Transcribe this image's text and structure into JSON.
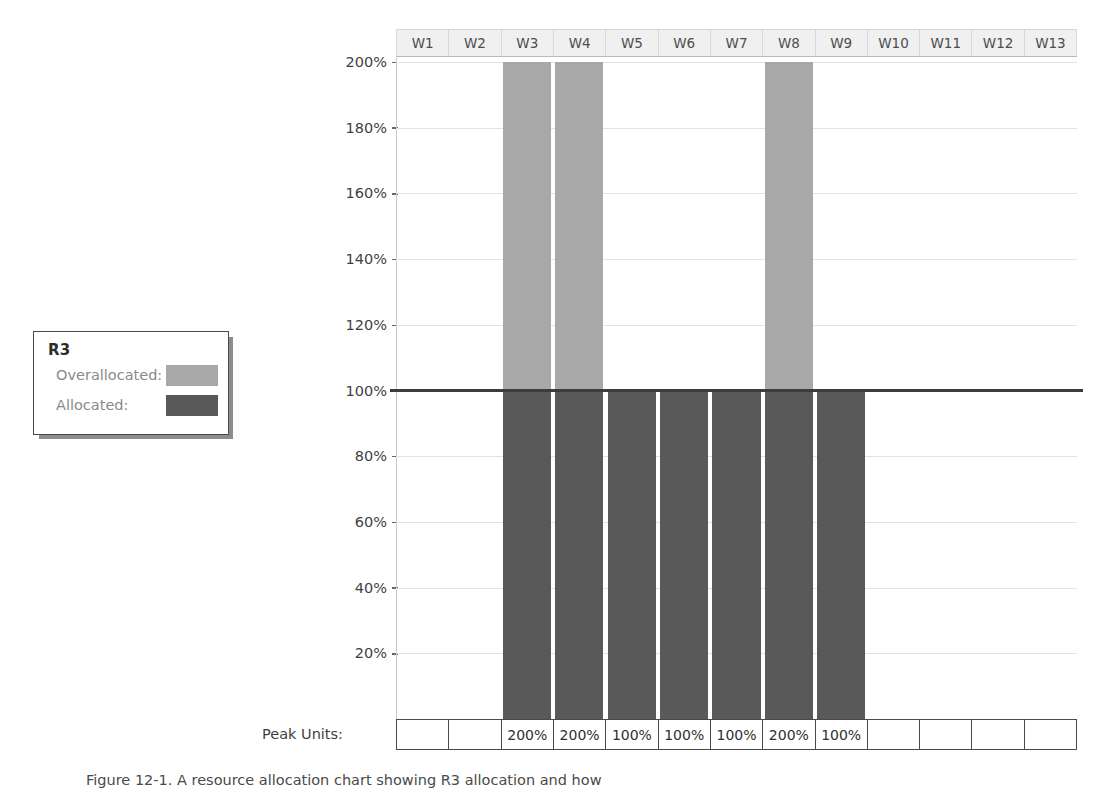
{
  "legend": {
    "title": "R3",
    "rows": [
      {
        "label": "Overallocated:",
        "color": "#a8a8a8"
      },
      {
        "label": "Allocated:",
        "color": "#595959"
      }
    ]
  },
  "chart_data": {
    "type": "bar",
    "title": "",
    "xlabel": "",
    "ylabel": "",
    "categories": [
      "W1",
      "W2",
      "W3",
      "W4",
      "W5",
      "W6",
      "W7",
      "W8",
      "W9",
      "W10",
      "W11",
      "W12",
      "W13"
    ],
    "values": [
      0,
      0,
      200,
      200,
      100,
      100,
      100,
      200,
      100,
      0,
      0,
      0,
      0
    ],
    "value_labels": [
      "",
      "",
      "200%",
      "200%",
      "100%",
      "100%",
      "100%",
      "200%",
      "100%",
      "",
      "",
      "",
      ""
    ],
    "series": [
      {
        "name": "Allocated",
        "color": "#595959",
        "values": [
          0,
          0,
          100,
          100,
          100,
          100,
          100,
          100,
          100,
          0,
          0,
          0,
          0
        ]
      },
      {
        "name": "Overallocated",
        "color": "#a8a8a8",
        "values": [
          0,
          0,
          100,
          100,
          0,
          0,
          0,
          100,
          0,
          0,
          0,
          0,
          0
        ]
      }
    ],
    "ylim": [
      0,
      200
    ],
    "yticks": [
      200,
      180,
      160,
      140,
      120,
      100,
      80,
      60,
      40,
      20
    ],
    "ytick_labels": [
      "200%",
      "180%",
      "160%",
      "140%",
      "120%",
      "100%",
      "80%",
      "60%",
      "40%",
      "20%"
    ],
    "reference_line": 100,
    "grid": true,
    "legend_position": "left-floating"
  },
  "peak_units": {
    "label": "Peak Units:",
    "values": [
      "",
      "",
      "200%",
      "200%",
      "100%",
      "100%",
      "100%",
      "200%",
      "100%",
      "",
      "",
      "",
      ""
    ]
  },
  "caption": {
    "text": "Figure 12-1.   A resource allocation chart showing R3 allocation and how"
  },
  "colors": {
    "allocated": "#595959",
    "overallocated": "#a8a8a8",
    "baseline": "#3c3c3c",
    "header_band": "#f0f0f0"
  }
}
